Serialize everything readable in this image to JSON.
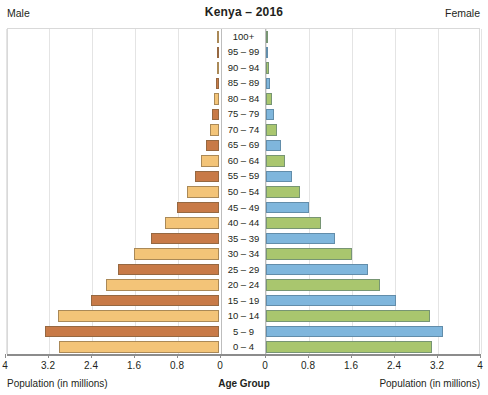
{
  "header": {
    "male_label": "Male",
    "female_label": "Female",
    "title": "Kenya – 2016"
  },
  "footer": {
    "left_axis_title": "Population (in millions)",
    "center_axis_title": "Age Group",
    "right_axis_title": "Population (in millions)"
  },
  "axis": {
    "left_ticks": [
      "4",
      "3.2",
      "2.4",
      "1.6",
      "0.8",
      "0"
    ],
    "right_ticks": [
      "0",
      "0.8",
      "1.6",
      "2.4",
      "3.2",
      "4"
    ]
  },
  "chart_data": {
    "type": "bar",
    "subtype": "population-pyramid",
    "title": "Kenya – 2016",
    "xlabel": "Population (in millions)",
    "ylabel": "Age Group",
    "xlim": [
      0,
      4
    ],
    "grid": true,
    "legend_position": "none",
    "categories": [
      "100+",
      "95 – 99",
      "90 – 94",
      "85 – 89",
      "80 – 84",
      "75 – 79",
      "70 – 74",
      "65 – 69",
      "60 – 64",
      "55 – 59",
      "50 – 54",
      "45 – 49",
      "40 – 44",
      "35 – 39",
      "30 – 34",
      "25 – 29",
      "20 – 24",
      "15 – 19",
      "10 – 14",
      "5 – 9",
      "0 – 4"
    ],
    "series": [
      {
        "name": "Male",
        "side": "left",
        "values": [
          0.01,
          0.03,
          0.04,
          0.06,
          0.09,
          0.13,
          0.17,
          0.24,
          0.33,
          0.45,
          0.6,
          0.78,
          1.0,
          1.27,
          1.58,
          1.88,
          2.1,
          2.38,
          3.0,
          3.23,
          2.98
        ],
        "colors_alternate": [
          "#f3c478",
          "#c87a47"
        ]
      },
      {
        "name": "Female",
        "side": "right",
        "values": [
          0.01,
          0.03,
          0.05,
          0.07,
          0.11,
          0.15,
          0.2,
          0.27,
          0.36,
          0.48,
          0.63,
          0.8,
          1.03,
          1.28,
          1.6,
          1.9,
          2.13,
          2.42,
          3.05,
          3.3,
          3.08
        ],
        "colors_alternate": [
          "#a9c66e",
          "#7fb6dc"
        ]
      }
    ],
    "colors": {
      "male_light": "#f3c478",
      "male_dark": "#c87a47",
      "female_green": "#a9c66e",
      "female_blue": "#7fb6dc",
      "grid": "#e4e4e4",
      "axis": "#8c8c8c"
    }
  }
}
